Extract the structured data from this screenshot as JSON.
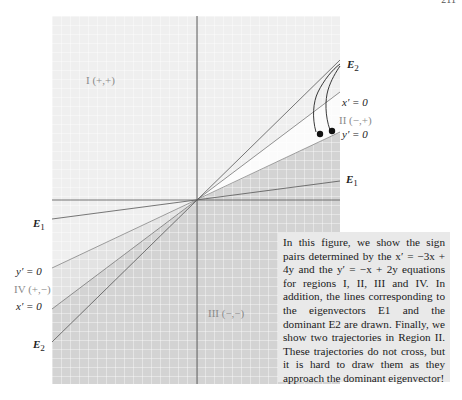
{
  "page": {
    "number": "211"
  },
  "figure": {
    "origin": [
      197,
      200
    ],
    "plot_box": {
      "left": 52,
      "top": 16,
      "right": 340,
      "bottom": 384
    },
    "colors": {
      "region_I": "#efefef",
      "region_II": "#fafafa",
      "region_III": "#d2d2d2",
      "region_IV": "#e4e4e4",
      "grid": "#ffffff",
      "axis": "#444444",
      "line": "#555555",
      "trajectory": "#222222"
    },
    "labels": {
      "region_I": "I (+,+)",
      "region_II": "II (−,+)",
      "region_III": "III (−,−)",
      "region_IV": "IV (+,−)",
      "E2_top": "E",
      "E2_top_sub": "2",
      "xprime_right": "x′ = 0",
      "yprime_right": "y′ = 0",
      "E1_right": "E",
      "E1_right_sub": "1",
      "E1_left": "E",
      "E1_left_sub": "1",
      "yprime_left": "y′ = 0",
      "xprime_left": "x′ = 0",
      "E2_left": "E",
      "E2_left_sub": "2"
    },
    "lines": [
      {
        "name": "E1",
        "slope": 0.13
      },
      {
        "name": "y_prime_zero",
        "slope": 0.5
      },
      {
        "name": "x_prime_zero",
        "slope": 0.75
      },
      {
        "name": "E2",
        "slope": 0.98
      }
    ],
    "equations": {
      "x_prime": "x′ = −3x + 4y",
      "y_prime": "y′ = −x + 2y"
    }
  },
  "caption": {
    "text": "In this figure, we show the sign pairs determined by the x′ = −3x + 4y and the y′ = −x + 2y equations for regions I, II, III and IV. In addition, the lines corresponding to the eigenvectors E1 and the dominant E2 are drawn. Finally, we show two trajectories in Region II. These trajectories do not cross, but it is hard to draw them as they approach the dominant eigenvector!"
  }
}
